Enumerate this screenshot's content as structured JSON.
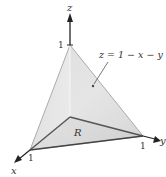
{
  "diagram": {
    "axes": {
      "x_label": "x",
      "y_label": "y",
      "z_label": "z",
      "x_tick": "1",
      "y_tick": "1",
      "z_tick": "1"
    },
    "surface_label": "z = 1 − x − y",
    "region_label": "R",
    "colors": {
      "face_fill": "#d9d9d9",
      "face_fill_light": "#ececec",
      "base_fill": "#cfcfcf",
      "edge": "#555555",
      "axis": "#222222"
    }
  }
}
